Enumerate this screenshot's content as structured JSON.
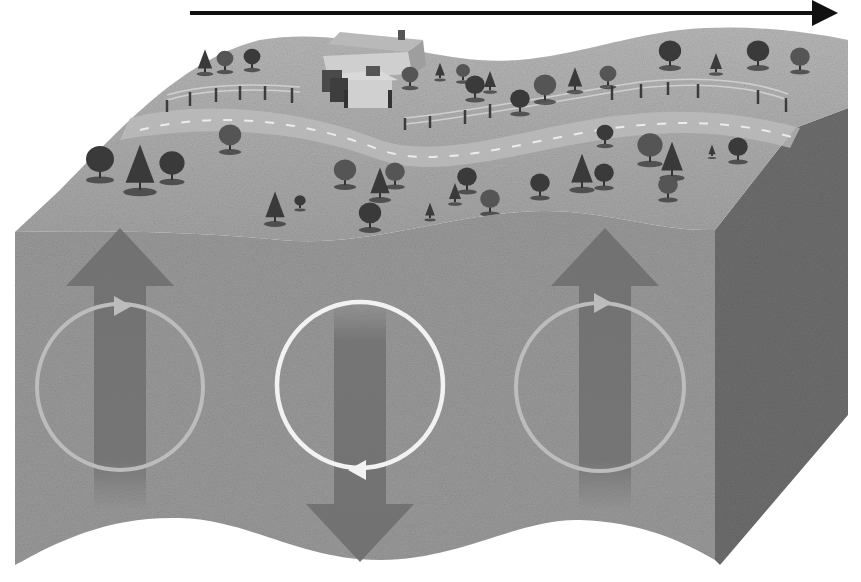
{
  "canvas": {
    "width": 861,
    "height": 582,
    "background": "#ffffff"
  },
  "colors": {
    "direction_arrow": "#111111",
    "front_face": "#9a9a9a",
    "side_face": "#6e6e6e",
    "top_surface": "#a9a9a9",
    "top_surface_far": "#b3b3b3",
    "road": "#bdbdbd",
    "road_dash": "#e6e6e6",
    "motion_arrow": "#707070",
    "orbit_faint": "#bcbcbc",
    "orbit_bright": "#f2f2f2",
    "tree_dark": "#3a3a3a",
    "tree_mid": "#555555",
    "house_roof": "#b9b9b9",
    "house_wall": "#d0d0d0",
    "house_trim": "#4a4a4a",
    "fence": "#3c3c3c"
  },
  "direction_arrow": {
    "x1": 190,
    "y1": 13,
    "x2": 838,
    "y2": 13,
    "label": "wave propagation direction"
  },
  "particle_motions": [
    {
      "id": "left",
      "direction": "up",
      "cx": 120,
      "arrow_top": 228,
      "arrow_bottom": 510,
      "orbit_cx": 120,
      "orbit_cy": 387,
      "orbit_r": 83,
      "orbit_style": "faint",
      "marker_y": 306,
      "marker_dir": "right"
    },
    {
      "id": "center",
      "direction": "down",
      "cx": 360,
      "arrow_top": 302,
      "arrow_bottom": 562,
      "orbit_cx": 360,
      "orbit_cy": 385,
      "orbit_r": 83,
      "orbit_style": "bright",
      "marker_y": 470,
      "marker_dir": "left"
    },
    {
      "id": "right",
      "direction": "up",
      "cx": 605,
      "arrow_top": 228,
      "arrow_bottom": 510,
      "orbit_cx": 600,
      "orbit_cy": 387,
      "orbit_r": 84,
      "orbit_style": "faint",
      "marker_y": 303,
      "marker_dir": "right"
    }
  ],
  "landscape": {
    "house": {
      "x": 318,
      "y": 30
    },
    "trees": [
      [
        100,
        178,
        20
      ],
      [
        140,
        190,
        24
      ],
      [
        172,
        180,
        18
      ],
      [
        230,
        150,
        16
      ],
      [
        205,
        72,
        12
      ],
      [
        225,
        70,
        12
      ],
      [
        252,
        68,
        12
      ],
      [
        275,
        222,
        16
      ],
      [
        300,
        208,
        8
      ],
      [
        345,
        185,
        16
      ],
      [
        380,
        198,
        16
      ],
      [
        395,
        185,
        14
      ],
      [
        370,
        228,
        16
      ],
      [
        430,
        218,
        8
      ],
      [
        467,
        190,
        14
      ],
      [
        410,
        86,
        12
      ],
      [
        440,
        78,
        8
      ],
      [
        463,
        80,
        10
      ],
      [
        475,
        98,
        14
      ],
      [
        490,
        90,
        10
      ],
      [
        520,
        112,
        14
      ],
      [
        545,
        100,
        16
      ],
      [
        575,
        90,
        12
      ],
      [
        608,
        85,
        12
      ],
      [
        670,
        66,
        16
      ],
      [
        716,
        72,
        10
      ],
      [
        758,
        66,
        16
      ],
      [
        800,
        70,
        14
      ],
      [
        455,
        202,
        10
      ],
      [
        490,
        212,
        14
      ],
      [
        540,
        196,
        14
      ],
      [
        582,
        188,
        18
      ],
      [
        604,
        186,
        14
      ],
      [
        650,
        162,
        18
      ],
      [
        672,
        176,
        18
      ],
      [
        668,
        198,
        14
      ],
      [
        605,
        144,
        12
      ],
      [
        712,
        156,
        6
      ],
      [
        738,
        160,
        14
      ]
    ]
  }
}
